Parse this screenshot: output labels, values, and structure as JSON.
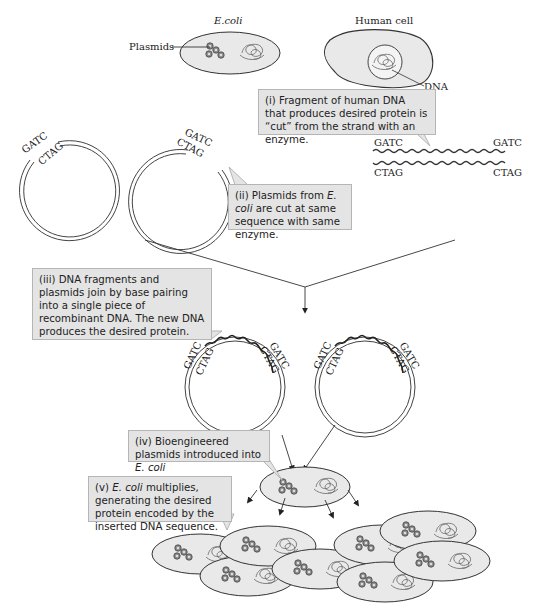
{
  "title_labels": {
    "ecoli": "E.coli",
    "human_cell": "Human cell",
    "plasmids": "Plasmids",
    "dna": "DNA"
  },
  "sequences": {
    "top_strand": "GATC",
    "bottom_strand": "CTAG"
  },
  "callouts": {
    "step1": "(i) Fragment of human DNA that produces desired protein is “cut” from the strand with an enzyme.",
    "step2_pre": "(ii) Plasmids from ",
    "step2_it": "E. coli",
    "step2_post": " are cut at same sequence with same enzyme.",
    "step3": "(iii) DNA fragments and plasmids join by base pairing into a single piece of recombinant DNA. The new DNA produces the desired protein.",
    "step4_pre": "(iv) Bioengineered plasmids introduced into ",
    "step4_it": "E. coli",
    "step5_it": "E. coli",
    "step5_post": " multiplies, generating the desired protein encoded by the inserted DNA sequence.",
    "step5_pre": "(v) "
  },
  "colors": {
    "cell_fill": "#e9e9e9",
    "callout_fill": "#e4e4e4",
    "stroke": "#333333"
  }
}
